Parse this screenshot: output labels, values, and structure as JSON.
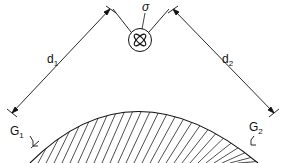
{
  "diagram": {
    "labels": {
      "source": "σ",
      "distance_1": "d",
      "distance_1_sub": "1",
      "distance_2": "d",
      "distance_2_sub": "2",
      "gauge_1": "G",
      "gauge_1_sub": "1",
      "gauge_2": "G",
      "gauge_2_sub": "2"
    },
    "colors": {
      "line": "#1a1a1a",
      "background": "#ffffff"
    }
  }
}
